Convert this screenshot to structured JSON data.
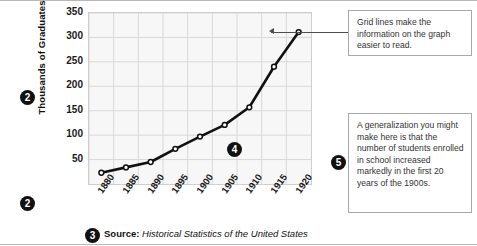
{
  "chart_data": {
    "type": "line",
    "title": "",
    "xlabel": "",
    "ylabel": "Thousands of Graduates",
    "categories": [
      "1880",
      "1885",
      "1890",
      "1895",
      "1900",
      "1905",
      "1910",
      "1915",
      "1920"
    ],
    "x": [
      1880,
      1885,
      1890,
      1895,
      1900,
      1905,
      1910,
      1915,
      1920
    ],
    "values": [
      23,
      34,
      45,
      72,
      97,
      121,
      157,
      240,
      311
    ],
    "ylim": [
      0,
      350
    ],
    "yticks": [
      50,
      100,
      150,
      200,
      250,
      300,
      350
    ],
    "xlim": [
      1880,
      1920
    ],
    "grid": true,
    "legend": false,
    "marker": "open-circle",
    "line_color": "#111111",
    "plot_background": "#f7f7f7",
    "grid_color": "#d8d8d8"
  },
  "axes": {
    "y_title": "Thousands of Graduates",
    "y_ticks": [
      "350",
      "300",
      "250",
      "200",
      "150",
      "100",
      "50"
    ],
    "x_ticks": [
      "1880",
      "1885",
      "1890",
      "1895",
      "1900",
      "1905",
      "1910",
      "1915",
      "1920"
    ]
  },
  "bullets": {
    "axis_label_marker_top": "2",
    "axis_label_marker_bottom": "2",
    "source_marker": "3",
    "gridline_marker": "4",
    "generalization_marker": "5"
  },
  "source": {
    "label": "Source:",
    "citation": "Historical Statistics of the United States"
  },
  "callouts": [
    {
      "id": "gridlines-note",
      "text": "Grid lines make the information on the graph easier to read."
    },
    {
      "id": "generalization-note",
      "text": "A generalization you might make here is that the number of students enrolled in school increased markedly in the first 20 years of the 1900s."
    }
  ],
  "colors": {
    "line": "#111111",
    "plot_bg": "#f7f7f7",
    "grid": "#d8d8d8",
    "callout_border": "#a8a8a8",
    "leader": "#4e4e4e",
    "bullet_bg": "#111111"
  }
}
